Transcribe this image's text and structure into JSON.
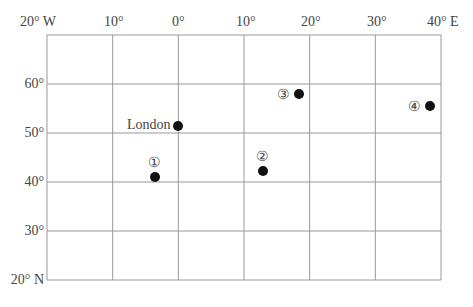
{
  "map": {
    "grid": {
      "longitudes": [
        -20,
        -10,
        0,
        10,
        20,
        30,
        40
      ],
      "latitudes": [
        20,
        30,
        40,
        50,
        60,
        70
      ],
      "line_color": "#999999"
    },
    "top_labels": [
      {
        "text": "20° W",
        "x": 20
      },
      {
        "text": "10°",
        "x": 104
      },
      {
        "text": "0°",
        "x": 172
      },
      {
        "text": "10°",
        "x": 236
      },
      {
        "text": "20°",
        "x": 301
      },
      {
        "text": "30°",
        "x": 367
      },
      {
        "text": "40° E",
        "x": 427
      }
    ],
    "left_labels": [
      {
        "text": "60°",
        "y": 76
      },
      {
        "text": "50°",
        "y": 125
      },
      {
        "text": "40°",
        "y": 174
      },
      {
        "text": "30°",
        "y": 223
      },
      {
        "text": "20° N",
        "y": 272
      }
    ],
    "points": [
      {
        "id": "london",
        "label": "London",
        "x": 178,
        "y": 126,
        "label_x": 127,
        "label_y": 117
      },
      {
        "id": "p1",
        "label": "①",
        "x": 155,
        "y": 177,
        "label_x": 148,
        "label_y": 154
      },
      {
        "id": "p2",
        "label": "②",
        "x": 263,
        "y": 171,
        "label_x": 256,
        "label_y": 148
      },
      {
        "id": "p3",
        "label": "③",
        "x": 299,
        "y": 94,
        "label_x": 277,
        "label_y": 86
      },
      {
        "id": "p4",
        "label": "④",
        "x": 430,
        "y": 106,
        "label_x": 408,
        "label_y": 98
      }
    ],
    "point_color": "#111111"
  }
}
